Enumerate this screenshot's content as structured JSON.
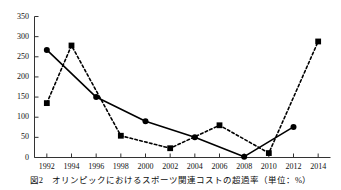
{
  "caption": {
    "figure_number": "図2",
    "text": "オリンピックにおけるスポーツ関連コストの超過率（単位：%）",
    "full": "図2　オリンピックにおけるスポーツ関連コストの超過率（単位：%）"
  },
  "chart_data": {
    "type": "line",
    "title": "",
    "subtitle": "",
    "xlabel": "",
    "ylabel": "",
    "unit": "%",
    "grid": false,
    "legend": false,
    "legend_position": "none",
    "x": [
      1992,
      1994,
      1996,
      1998,
      2000,
      2002,
      2004,
      2006,
      2008,
      2010,
      2012,
      2014
    ],
    "categories": [
      "1992",
      "1994",
      "1996",
      "1998",
      "2000",
      "2002",
      "2004",
      "2006",
      "2008",
      "2010",
      "2012",
      "2014"
    ],
    "xlim": [
      1991,
      2015
    ],
    "ylim": [
      0,
      350
    ],
    "ytick_values": [
      0,
      50,
      100,
      150,
      200,
      250,
      300,
      350
    ],
    "ytick_labels": [
      "0",
      "50",
      "100",
      "150",
      "200",
      "250",
      "300",
      "350"
    ],
    "xtick_labels": [
      "1992",
      "1994",
      "1996",
      "1998",
      "2000",
      "2002",
      "2004",
      "2006",
      "2008",
      "2010",
      "2012",
      "2014"
    ],
    "series": [
      {
        "name": "summer-games-series",
        "marker": "circle",
        "line_style": "solid",
        "color": "#000000",
        "points": [
          {
            "x": 1992,
            "y": 267
          },
          {
            "x": 1996,
            "y": 150
          },
          {
            "x": 2000,
            "y": 90
          },
          {
            "x": 2004,
            "y": 50
          },
          {
            "x": 2008,
            "y": 2
          },
          {
            "x": 2012,
            "y": 76
          }
        ]
      },
      {
        "name": "winter-games-series",
        "marker": "square",
        "line_style": "dashed",
        "color": "#000000",
        "points": [
          {
            "x": 1992,
            "y": 135
          },
          {
            "x": 1994,
            "y": 278
          },
          {
            "x": 1998,
            "y": 54
          },
          {
            "x": 2002,
            "y": 23
          },
          {
            "x": 2006,
            "y": 80
          },
          {
            "x": 2010,
            "y": 11
          },
          {
            "x": 2014,
            "y": 288
          }
        ]
      }
    ]
  }
}
